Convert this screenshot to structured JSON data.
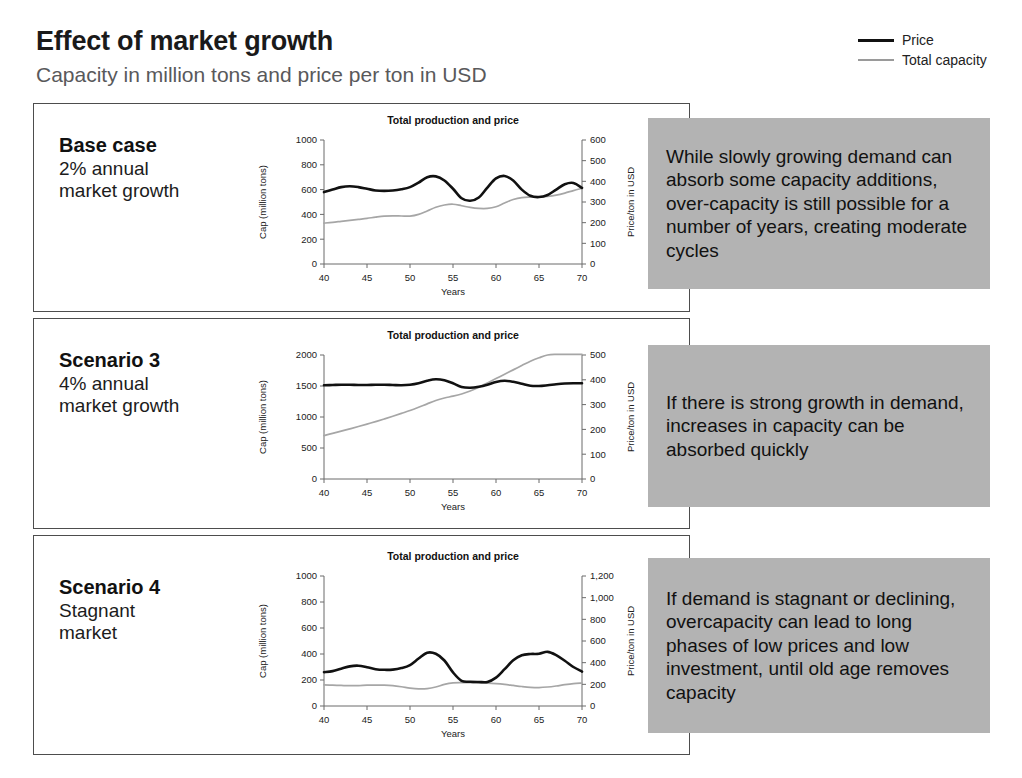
{
  "header": {
    "title": "Effect of market growth",
    "subtitle": "Capacity in million tons and price per ton in USD"
  },
  "legend": {
    "items": [
      {
        "label": "Price",
        "icon": "thick-black-line-icon",
        "color": "#111111"
      },
      {
        "label": "Total capacity",
        "icon": "thin-gray-line-icon",
        "color": "#9a9a9a"
      }
    ]
  },
  "colors": {
    "price_line": "#111111",
    "capacity_line": "#a6a6a6",
    "comment_background": "#b3b3b3",
    "panel_border": "#4d4d4d",
    "subtitle_text": "#59595b"
  },
  "scenarios": [
    {
      "name": "Base case",
      "description": "2% annual\nmarket growth",
      "comment": "While slowly growing demand can absorb some capacity additions, over-capacity is still possible for a number of years, creating moderate cycles"
    },
    {
      "name": "Scenario 3",
      "description": "4% annual\nmarket growth",
      "comment": "If there is strong growth in demand, increases in capacity can be absorbed quickly"
    },
    {
      "name": "Scenario 4",
      "description": "Stagnant\nmarket",
      "comment": "If demand is stagnant or declining, overcapacity can lead to long phases of low prices and low investment, until old age removes capacity"
    }
  ],
  "chart_data": [
    {
      "type": "line",
      "title": "Total production and price",
      "xlabel": "Years",
      "ylabel": "Cap (million tons)",
      "y2label": "Price/ton in USD",
      "xlim": [
        40,
        70
      ],
      "xticks": [
        40,
        45,
        50,
        55,
        60,
        65,
        70
      ],
      "ylim": [
        0,
        1000
      ],
      "yticks": [
        0,
        200,
        400,
        600,
        800,
        1000
      ],
      "y2lim": [
        0,
        600
      ],
      "y2ticks": [
        0,
        100,
        200,
        300,
        400,
        500,
        600
      ],
      "y2ticklabels": [
        "0",
        "100",
        "200",
        "300",
        "400",
        "500",
        "600"
      ],
      "grid": false,
      "legend_position": "external-top-right",
      "x": [
        40,
        41,
        42,
        43,
        44,
        45,
        46,
        47,
        48,
        49,
        50,
        51,
        52,
        53,
        54,
        55,
        56,
        57,
        58,
        59,
        60,
        61,
        62,
        63,
        64,
        65,
        66,
        67,
        68,
        69,
        70
      ],
      "series": [
        {
          "name": "Total capacity",
          "axis": "left",
          "values": [
            330,
            336,
            344,
            352,
            360,
            368,
            378,
            386,
            388,
            387,
            386,
            400,
            428,
            458,
            476,
            482,
            470,
            456,
            448,
            448,
            462,
            492,
            520,
            536,
            540,
            541,
            546,
            556,
            572,
            592,
            610
          ]
        },
        {
          "name": "Price",
          "axis": "right",
          "values": [
            348,
            360,
            372,
            376,
            372,
            364,
            356,
            354,
            356,
            362,
            372,
            394,
            420,
            424,
            404,
            364,
            318,
            306,
            322,
            370,
            414,
            426,
            404,
            360,
            330,
            324,
            334,
            360,
            386,
            392,
            368
          ]
        }
      ]
    },
    {
      "type": "line",
      "title": "Total production and price",
      "xlabel": "Years",
      "ylabel": "Cap (million tons)",
      "y2label": "Price/ton in USD",
      "xlim": [
        40,
        70
      ],
      "xticks": [
        40,
        45,
        50,
        55,
        60,
        65,
        70
      ],
      "ylim": [
        0,
        2000
      ],
      "yticks": [
        0,
        500,
        1000,
        1500,
        2000
      ],
      "y2lim": [
        0,
        500
      ],
      "y2ticks": [
        0,
        100,
        200,
        300,
        400,
        500
      ],
      "y2ticklabels": [
        "0",
        "100",
        "200",
        "300",
        "400",
        "500"
      ],
      "grid": false,
      "legend_position": "external-top-right",
      "x": [
        40,
        41,
        42,
        43,
        44,
        45,
        46,
        47,
        48,
        49,
        50,
        51,
        52,
        53,
        54,
        55,
        56,
        57,
        58,
        59,
        60,
        61,
        62,
        63,
        64,
        65,
        66,
        67,
        68,
        69,
        70
      ],
      "series": [
        {
          "name": "Total capacity",
          "axis": "left",
          "values": [
            700,
            736,
            772,
            808,
            846,
            886,
            926,
            968,
            1012,
            1058,
            1104,
            1156,
            1212,
            1266,
            1306,
            1336,
            1372,
            1420,
            1480,
            1550,
            1620,
            1690,
            1760,
            1830,
            1900,
            1955,
            2000,
            2010,
            2010,
            2010,
            2010
          ]
        },
        {
          "name": "Price",
          "axis": "right",
          "values": [
            378,
            379,
            380,
            380,
            379,
            379,
            380,
            380,
            379,
            378,
            380,
            386,
            396,
            402,
            398,
            386,
            371,
            368,
            372,
            380,
            391,
            396,
            392,
            384,
            376,
            375,
            378,
            382,
            385,
            386,
            386
          ]
        }
      ]
    },
    {
      "type": "line",
      "title": "Total production and price",
      "xlabel": "Years",
      "ylabel": "Cap (million tons)",
      "y2label": "Price/ton in USD",
      "xlim": [
        40,
        70
      ],
      "xticks": [
        40,
        45,
        50,
        55,
        60,
        65,
        70
      ],
      "ylim": [
        0,
        1000
      ],
      "yticks": [
        0,
        200,
        400,
        600,
        800,
        1000
      ],
      "y2lim": [
        0,
        1200
      ],
      "y2ticks": [
        0,
        200,
        400,
        600,
        800,
        1000,
        1200
      ],
      "y2ticklabels": [
        "0",
        "200",
        "400",
        "600",
        "800",
        "1,000",
        "1,200"
      ],
      "grid": false,
      "legend_position": "external-top-right",
      "x": [
        40,
        41,
        42,
        43,
        44,
        45,
        46,
        47,
        48,
        49,
        50,
        51,
        52,
        53,
        54,
        55,
        56,
        57,
        58,
        59,
        60,
        61,
        62,
        63,
        64,
        65,
        66,
        67,
        68,
        69,
        70
      ],
      "series": [
        {
          "name": "Total capacity",
          "axis": "left",
          "values": [
            162,
            160,
            158,
            156,
            157,
            160,
            161,
            160,
            156,
            148,
            138,
            132,
            134,
            146,
            166,
            178,
            180,
            180,
            178,
            176,
            172,
            166,
            158,
            150,
            144,
            142,
            146,
            154,
            164,
            172,
            176
          ]
        },
        {
          "name": "Price",
          "axis": "right",
          "values": [
            312,
            322,
            344,
            366,
            372,
            358,
            340,
            334,
            336,
            350,
            378,
            438,
            492,
            482,
            420,
            310,
            232,
            224,
            222,
            222,
            262,
            340,
            422,
            468,
            480,
            482,
            500,
            470,
            418,
            360,
            318
          ]
        }
      ]
    }
  ]
}
